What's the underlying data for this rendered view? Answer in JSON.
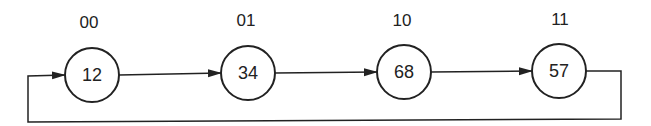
{
  "diagram": {
    "type": "circular-linked-list",
    "nodes": [
      {
        "address": "00",
        "value": "12"
      },
      {
        "address": "01",
        "value": "34"
      },
      {
        "address": "10",
        "value": "68"
      },
      {
        "address": "11",
        "value": "57"
      }
    ],
    "edges": [
      {
        "from": "00",
        "to": "01"
      },
      {
        "from": "01",
        "to": "10"
      },
      {
        "from": "10",
        "to": "11"
      },
      {
        "from": "11",
        "to": "00",
        "style": "loop-back-below"
      }
    ],
    "colors": {
      "stroke": "#222222",
      "background": "#ffffff"
    }
  }
}
